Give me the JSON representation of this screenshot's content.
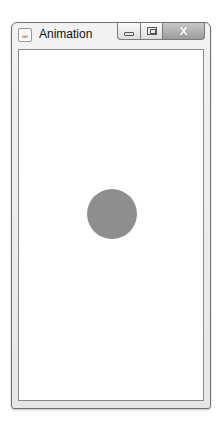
{
  "window": {
    "title": "Animation",
    "app_icon": "java-cup-icon",
    "controls": {
      "minimize": "minimize-icon",
      "maximize": "maximize-icon",
      "close_label": "X"
    }
  },
  "canvas": {
    "background": "#ffffff",
    "ball": {
      "shape": "circle",
      "color": "#8e8e8e"
    }
  }
}
